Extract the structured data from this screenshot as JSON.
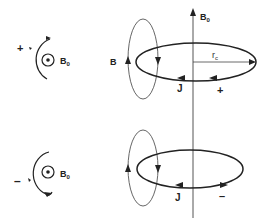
{
  "diagram": {
    "axis": {
      "label": "B",
      "label_sub": "0"
    },
    "upper": {
      "side_sign": "+",
      "side_field_label": "B",
      "side_field_sub": "0",
      "loop_field_label": "B",
      "current_label": "J",
      "charge_sign": "+",
      "radius_label": "r",
      "radius_sub": "c"
    },
    "lower": {
      "side_sign": "–",
      "side_field_label": "B",
      "side_field_sub": "0",
      "current_label": "J",
      "charge_sign": "–"
    },
    "colors": {
      "stroke": "#222222",
      "background": "#ffffff"
    }
  }
}
